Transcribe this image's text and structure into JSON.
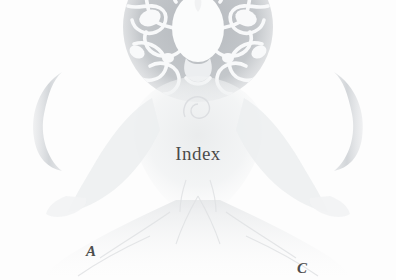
{
  "page": {
    "background_color": "#fdfdfd",
    "width": 396,
    "height": 280
  },
  "artwork": {
    "name": "meditating-figure-with-halo",
    "description": "Faded engraving of a seated meditating figure with ornate circular halo, flanked by two crescent moons",
    "ink_color": "#b9bcc0",
    "halo_fill_color": "#b2b6ba",
    "halo_ornament_color": "#f7f8f9",
    "moon_color": "#cfd2d6",
    "figure_color": "#e6e8ea"
  },
  "overlay": {
    "index_label": "Index",
    "index_color": "#4b4b4b",
    "marker_a": "A",
    "marker_c": "C",
    "marker_color": "#4d4d4d"
  }
}
